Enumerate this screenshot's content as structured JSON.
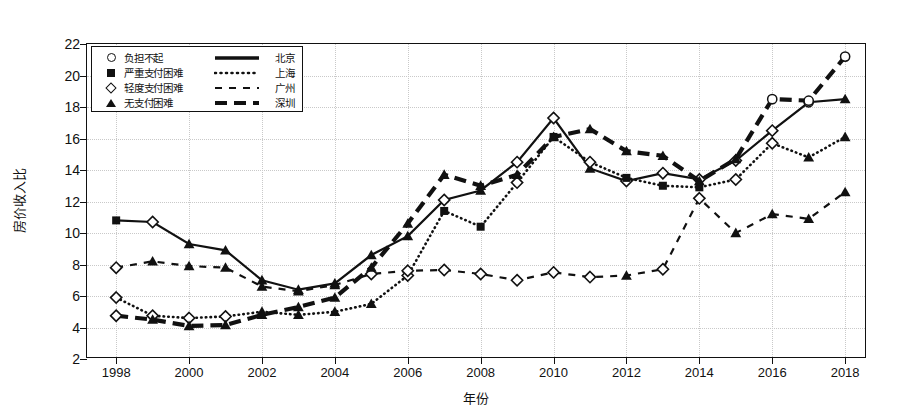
{
  "chart_data": {
    "type": "line",
    "title": "",
    "xlabel": "年份",
    "ylabel": "房价收入比",
    "xlim": [
      1997.2,
      2018.6
    ],
    "ylim": [
      2,
      22
    ],
    "xticks": [
      1998,
      2000,
      2002,
      2004,
      2006,
      2008,
      2010,
      2012,
      2014,
      2016,
      2018
    ],
    "yticks": [
      2,
      4,
      6,
      8,
      10,
      12,
      14,
      16,
      18,
      20,
      22
    ],
    "grid": true,
    "legend_position": "top-left",
    "x": [
      1998,
      1999,
      2000,
      2001,
      2002,
      2003,
      2004,
      2005,
      2006,
      2007,
      2008,
      2009,
      2010,
      2011,
      2012,
      2013,
      2014,
      2015,
      2016,
      2017,
      2018
    ],
    "series": [
      {
        "name": "北京",
        "linestyle": "solid",
        "values": [
          10.8,
          10.7,
          9.3,
          8.9,
          7.0,
          6.4,
          6.8,
          8.6,
          9.8,
          12.1,
          12.7,
          14.5,
          17.3,
          14.1,
          13.3,
          13.8,
          13.4,
          14.6,
          16.5,
          18.3,
          18.5
        ]
      },
      {
        "name": "上海",
        "linestyle": "dotted",
        "values": [
          5.9,
          4.75,
          4.6,
          4.7,
          5.0,
          4.8,
          5.0,
          5.5,
          7.3,
          11.4,
          10.4,
          13.2,
          16.1,
          14.5,
          13.5,
          13.0,
          12.9,
          13.4,
          15.7,
          14.8,
          16.1
        ]
      },
      {
        "name": "广州",
        "linestyle": "dashed",
        "values": [
          7.8,
          8.2,
          7.9,
          7.8,
          6.6,
          6.3,
          6.7,
          7.4,
          7.6,
          7.65,
          7.4,
          7.0,
          7.5,
          7.2,
          7.3,
          7.7,
          12.2,
          10.0,
          11.2,
          10.9,
          12.6
        ]
      },
      {
        "name": "深圳",
        "linestyle": "dashed-thick",
        "values": [
          4.75,
          4.5,
          4.1,
          4.15,
          4.8,
          5.3,
          5.9,
          7.8,
          10.6,
          13.7,
          13.0,
          13.7,
          16.1,
          16.6,
          15.2,
          14.9,
          13.3,
          14.7,
          18.5,
          18.4,
          21.2
        ]
      }
    ],
    "marker_legend": [
      {
        "marker": "circle",
        "label": "负担不起"
      },
      {
        "marker": "square",
        "label": "严重支付困难"
      },
      {
        "marker": "diamond",
        "label": "轻度支付困难"
      },
      {
        "marker": "triangle",
        "label": "无支付困难"
      }
    ],
    "line_legend": [
      {
        "style": "solid",
        "label": "北京"
      },
      {
        "style": "dotted",
        "label": "上海"
      },
      {
        "style": "dashed",
        "label": "广州"
      },
      {
        "style": "dashed-thick",
        "label": "深圳"
      }
    ],
    "marker_thresholds": {
      "circle_min": 18.0,
      "square_range": [
        10.0,
        14.0
      ],
      "diamond_max": 10.0,
      "note": "marker glyph per point encodes affordability category"
    },
    "markers_by_series": {
      "北京": [
        "square",
        "diamond",
        "triangle",
        "triangle",
        "triangle",
        "triangle",
        "triangle",
        "triangle",
        "triangle",
        "diamond",
        "triangle",
        "diamond",
        "diamond",
        "triangle",
        "diamond",
        "diamond",
        "diamond",
        "diamond",
        "diamond",
        "circle",
        "triangle"
      ],
      "上海": [
        "diamond",
        "diamond",
        "diamond",
        "diamond",
        "triangle",
        "triangle",
        "triangle",
        "triangle",
        "diamond",
        "square",
        "square",
        "diamond",
        "square",
        "diamond",
        "square",
        "square",
        "square",
        "diamond",
        "diamond",
        "triangle",
        "triangle"
      ],
      "广州": [
        "diamond",
        "triangle",
        "triangle",
        "triangle",
        "triangle",
        "triangle",
        "triangle",
        "diamond",
        "diamond",
        "diamond",
        "diamond",
        "diamond",
        "diamond",
        "diamond",
        "triangle",
        "diamond",
        "diamond",
        "triangle",
        "triangle",
        "triangle",
        "triangle"
      ],
      "深圳": [
        "diamond",
        "triangle",
        "triangle",
        "triangle",
        "triangle",
        "triangle",
        "triangle",
        "triangle",
        "triangle",
        "triangle",
        "triangle",
        "triangle",
        "triangle",
        "triangle",
        "triangle",
        "triangle",
        "triangle",
        "triangle",
        "circle",
        "circle",
        "circle"
      ]
    }
  }
}
